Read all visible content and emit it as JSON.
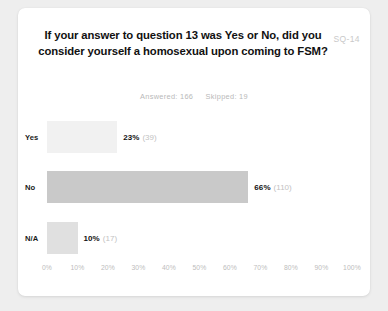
{
  "card": {
    "question_code": "SQ-14",
    "title": "If your answer to question 13 was Yes or No, did you consider yourself a homosexual upon coming to FSM?",
    "answered_label": "Answered: 166",
    "skipped_label": "Skipped: 19"
  },
  "chart_data": {
    "type": "bar",
    "orientation": "horizontal",
    "title": "If your answer to question 13 was Yes or No, did you consider yourself a homosexual upon coming to FSM?",
    "xlabel": "",
    "ylabel": "",
    "xlim": [
      0,
      100
    ],
    "grid": false,
    "legend": null,
    "categories": [
      "Yes",
      "No",
      "N/A"
    ],
    "values": [
      23,
      66,
      10
    ],
    "counts": [
      39,
      110,
      17
    ],
    "value_labels": [
      "23%",
      "66%",
      "10%"
    ],
    "count_labels": [
      "(39)",
      "(110)",
      "(17)"
    ],
    "bar_colors": [
      "#f1f1f1",
      "#c9c9c9",
      "#e0e0e0"
    ],
    "xticks": [
      0,
      10,
      20,
      30,
      40,
      50,
      60,
      70,
      80,
      90,
      100
    ],
    "xtick_labels": [
      "0%",
      "10%",
      "20%",
      "30%",
      "40%",
      "50%",
      "60%",
      "70%",
      "80%",
      "90%",
      "100%"
    ],
    "answered": 166,
    "skipped": 19
  },
  "colors": {
    "page_background": "#eeeeee",
    "card_background": "#ffffff",
    "title_text": "#111111",
    "muted_text": "#bdbdbd",
    "bar_yes": "#f1f1f1",
    "bar_no": "#c9c9c9",
    "bar_na": "#e0e0e0"
  }
}
